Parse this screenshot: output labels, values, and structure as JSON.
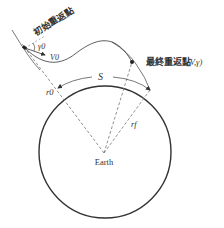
{
  "diagram": {
    "initial_point_label": "初始重返點",
    "final_point_label": "最終重返點",
    "final_point_params": "(V,γ)",
    "gamma0_label": "γ0",
    "v0_label": "V0",
    "range_label": "S",
    "r0_label": "r0",
    "rf_label": "rf",
    "earth_label": "Earth",
    "colors": {
      "line": "#333333",
      "dashed": "#777777",
      "background": "#ffffff"
    }
  }
}
